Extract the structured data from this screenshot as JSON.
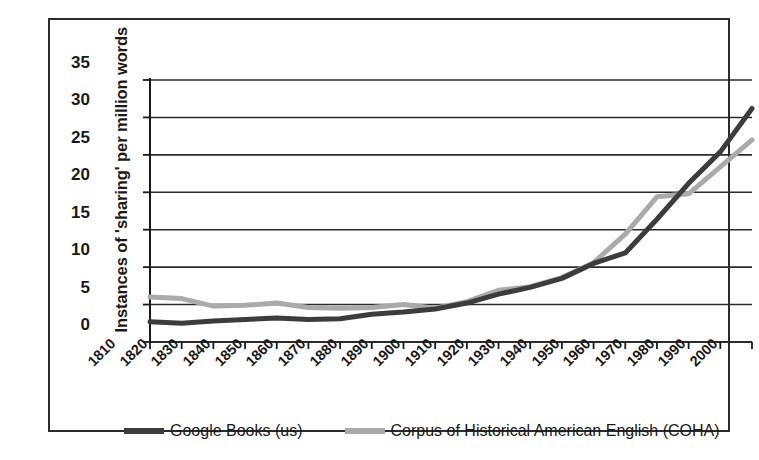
{
  "chart_data": {
    "type": "line",
    "title": "",
    "xlabel": "",
    "ylabel": "Instances of 'sharing' per million words",
    "ylim": [
      0,
      35
    ],
    "yticks": [
      0,
      5,
      10,
      15,
      20,
      25,
      30,
      35
    ],
    "grid": true,
    "legend_position": "bottom",
    "categories": [
      "1810",
      "1820",
      "1830",
      "1840",
      "1850",
      "1860",
      "1870",
      "1880",
      "1890",
      "1900",
      "1910",
      "1920",
      "1930",
      "1940",
      "1950",
      "1960",
      "1970",
      "1980",
      "1990",
      "2000"
    ],
    "series": [
      {
        "name": "Google Books (us)",
        "color": "#3c3c3c",
        "values": [
          2.7,
          2.5,
          2.8,
          3.0,
          3.2,
          3.0,
          3.1,
          3.7,
          4.0,
          4.4,
          5.2,
          6.4,
          7.3,
          8.5,
          10.5,
          11.9,
          16.4,
          21.2,
          25.4,
          31.2
        ]
      },
      {
        "name": "Corpus of Historical American English (COHA)",
        "color": "#aaaaaa",
        "values": [
          6.0,
          5.8,
          4.8,
          4.9,
          5.2,
          4.6,
          4.5,
          4.6,
          5.0,
          4.5,
          5.4,
          6.9,
          7.4,
          8.6,
          10.6,
          14.4,
          19.4,
          19.8,
          23.4,
          27.0
        ]
      }
    ]
  },
  "legend": {
    "entries": [
      {
        "label": "Google Books (us)",
        "swatch": "dark-line-swatch"
      },
      {
        "label": "Corpus of Historical American English (COHA)",
        "swatch": "light-line-swatch"
      }
    ]
  },
  "axis": {
    "y_title": "Instances of 'sharing' per million words"
  },
  "colors": {
    "series_dark": "#3c3c3c",
    "series_light": "#aaaaaa",
    "axis": "#1a1a1a",
    "grid": "#2b2b2b",
    "frame": "#2b2b2b",
    "background": "#ffffff"
  }
}
